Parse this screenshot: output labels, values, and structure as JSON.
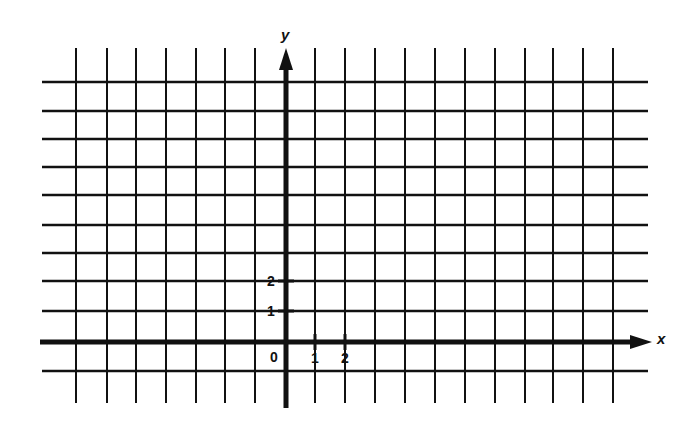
{
  "diagram": {
    "type": "coordinate-grid",
    "colors": {
      "background": "#ffffff",
      "ink": "#111111"
    },
    "grid": {
      "vertical_lines_x": [
        76,
        107,
        136,
        166,
        196,
        225,
        255,
        315,
        345,
        375,
        405,
        435,
        465,
        495,
        525,
        553,
        583,
        613
      ],
      "horizontal_lines_y": [
        82,
        111,
        139,
        167,
        195,
        225,
        253,
        281,
        311,
        371
      ],
      "h_line_x_start": 42,
      "h_line_x_end": 648,
      "v_line_y_start": 48,
      "v_line_y_end": 403
    },
    "axes": {
      "x": {
        "label": "x",
        "y": 342,
        "x_start": 40,
        "arrow_tip_x": 652,
        "label_pos": [
          657,
          344
        ]
      },
      "y": {
        "label": "y",
        "x": 286,
        "y_end": 408,
        "arrow_tip_y": 48,
        "label_pos": [
          281,
          40
        ]
      }
    },
    "origin_label": "0",
    "x_ticks": [
      {
        "label": "1",
        "x": 315
      },
      {
        "label": "2",
        "x": 345
      }
    ],
    "y_ticks": [
      {
        "label": "1",
        "y": 311
      },
      {
        "label": "2",
        "y": 281
      }
    ]
  }
}
